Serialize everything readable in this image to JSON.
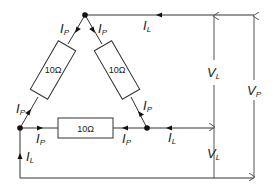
{
  "diagram": {
    "type": "delta-connected three-phase load",
    "resistors": [
      {
        "id": "left",
        "label": "10Ω"
      },
      {
        "id": "right",
        "label": "10Ω"
      },
      {
        "id": "bottom",
        "label": "10Ω"
      }
    ],
    "current_labels": {
      "phase_main": "I",
      "phase_sub": "P",
      "line_main": "I",
      "line_sub": "L"
    },
    "voltage_labels": {
      "line_main": "V",
      "line_sub": "L",
      "phase_main": "V",
      "phase_sub": "P"
    },
    "colors": {
      "wire": "#333333",
      "node": "#111111",
      "text": "#222222"
    }
  }
}
